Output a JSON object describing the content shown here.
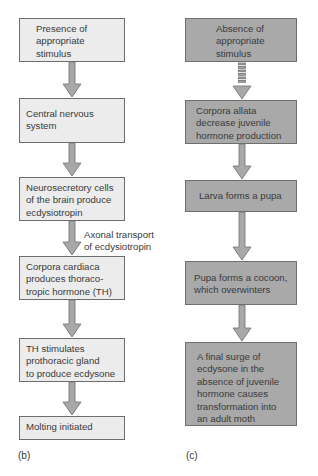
{
  "panel_b": {
    "label": "(b)",
    "steps": [
      {
        "text": "Presence of\nappropriate\nstimulus"
      },
      {
        "text": "Central nervous\nsystem"
      },
      {
        "text": "Neurosecretory cells\nof the brain produce\necdysiotropin"
      },
      {
        "text": "Corpora cardiaca\nproduces thoraco-\ntropic hormone (TH)"
      },
      {
        "text": "TH stimulates\nprothoracic gland\nto produce ecdysone"
      },
      {
        "text": "Molting initiated"
      }
    ],
    "arrow_annotation": "Axonal transport\nof ecdysiotropin"
  },
  "panel_c": {
    "label": "(c)",
    "steps": [
      {
        "text": "Absence of\nappropriate\nstimulus"
      },
      {
        "text": "Corpora allata\ndecrease juvenile\nhormone production"
      },
      {
        "text": "Larva forms a pupa"
      },
      {
        "text": "Pupa forms a cocoon,\nwhich overwinters"
      },
      {
        "text": "A final surge of\necdysone in the\nabsence of juvenile\nhormone causes\ntransformation into\nan adult moth"
      }
    ]
  },
  "colors": {
    "light_box": "#ececec",
    "dark_box": "#a9a9a9",
    "arrow_fill": "#a8a8a8",
    "border": "#6e6e6e"
  }
}
